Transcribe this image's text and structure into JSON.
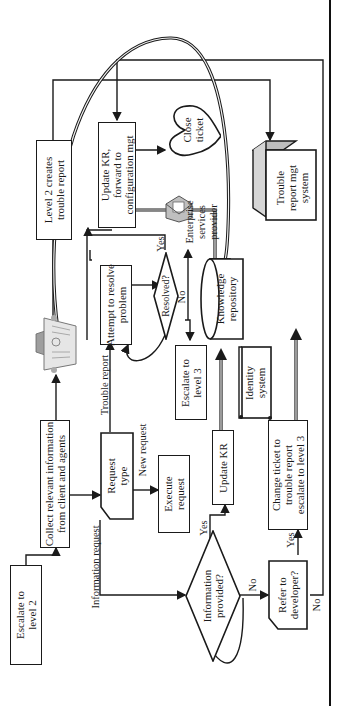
{
  "diagram": {
    "orientation": "rotated-90-ccw",
    "nodes": {
      "escalate_l2": "Escalate to\nlevel 2",
      "collect_info": "Collect relevant information\nfrom client and agents",
      "request_type": "Request\ntype",
      "execute_request": "Execute\nrequest",
      "info_provided": "Information\nprovided?",
      "update_kr": "Update KR",
      "refer_dev": "Refer to\ndeveloper?",
      "change_ticket": "Change ticket to\ntrouble report\nescalate to level 3",
      "attempt_resolve": "Attempt to resolve\nproblem",
      "resolved": "Resolved?",
      "escalate_l3": "Escalate to\nlevel 3",
      "knowledge_repo": "Knowledge\nrepository",
      "identity_system": "Identity\nsystem",
      "level2_creates": "Level 2 creates\ntrouble report",
      "update_kr_forward": "Update KR,\nforward to\nconfiguration mgt",
      "close_ticket": "Close\nticket",
      "enterprise_provider": "Enterprise\nservices\nprovider",
      "trouble_report_system": "Trouble\nreport mgt\nsystem"
    },
    "edge_labels": {
      "information_request": "Information request",
      "trouble_report": "Trouble report",
      "new_request": "New request",
      "yes_info": "Yes",
      "no_info": "No",
      "yes_resolved": "Yes",
      "no_resolved": "No",
      "yes_refer": "Yes",
      "no_refer": "No"
    },
    "icons": {
      "newspaper": "newspaper-icon",
      "envelope": "envelope-icon"
    },
    "colors": {
      "line": "#1a1a1a",
      "double_line": "#8a8a8a",
      "cube_top": "#bdbdbd",
      "cube_side": "#d6d6d6"
    }
  }
}
